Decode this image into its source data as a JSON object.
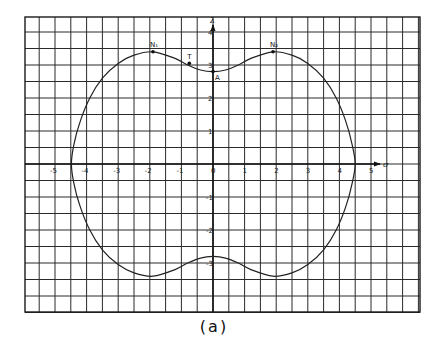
{
  "figure": {
    "caption": "(a)",
    "x_axis_name": "σ",
    "y_axis_name": "λ"
  },
  "chart_data": {
    "type": "line",
    "title": "",
    "xlabel": "σ",
    "ylabel": "λ",
    "xlim": [
      -6.0,
      6.5
    ],
    "ylim": [
      -4.5,
      4.5
    ],
    "grid": true,
    "x_ticks": [
      -5,
      -4,
      -3,
      -2,
      -1,
      0,
      1,
      2,
      3,
      4,
      5
    ],
    "x_tick_labels": [
      "-5",
      "-4",
      "-3",
      "-2",
      "-1",
      "0",
      "1",
      "2",
      "3",
      "4",
      "5"
    ],
    "y_ticks": [
      4,
      3,
      2,
      1,
      -1,
      -2,
      -3
    ],
    "y_tick_labels": [
      "4",
      "3",
      "2",
      "1",
      "-1",
      "-2",
      "-3"
    ],
    "series": [
      {
        "name": "closed locus",
        "description": "Closed curve symmetric about both axes, with shallow dimples at top and bottom near x=0",
        "points": [
          [
            0,
            2.8
          ],
          [
            -0.4,
            2.85
          ],
          [
            -0.8,
            3.0
          ],
          [
            -1.2,
            3.2
          ],
          [
            -1.9,
            3.4
          ],
          [
            -2.5,
            3.3
          ],
          [
            -3.0,
            3.05
          ],
          [
            -3.5,
            2.6
          ],
          [
            -3.9,
            2.0
          ],
          [
            -4.2,
            1.3
          ],
          [
            -4.4,
            0.6
          ],
          [
            -4.48,
            0
          ],
          [
            -4.4,
            -0.6
          ],
          [
            -4.2,
            -1.3
          ],
          [
            -3.9,
            -2.0
          ],
          [
            -3.5,
            -2.6
          ],
          [
            -3.0,
            -3.05
          ],
          [
            -2.5,
            -3.3
          ],
          [
            -1.9,
            -3.4
          ],
          [
            -1.2,
            -3.2
          ],
          [
            -0.8,
            -3.0
          ],
          [
            -0.4,
            -2.85
          ],
          [
            0,
            -2.8
          ],
          [
            0.4,
            -2.85
          ],
          [
            0.8,
            -3.0
          ],
          [
            1.2,
            -3.2
          ],
          [
            1.9,
            -3.4
          ],
          [
            2.5,
            -3.3
          ],
          [
            3.0,
            -3.05
          ],
          [
            3.5,
            -2.6
          ],
          [
            3.9,
            -2.0
          ],
          [
            4.2,
            -1.3
          ],
          [
            4.4,
            -0.6
          ],
          [
            4.5,
            0
          ],
          [
            4.4,
            0.6
          ],
          [
            4.2,
            1.3
          ],
          [
            3.9,
            2.0
          ],
          [
            3.5,
            2.6
          ],
          [
            3.0,
            3.05
          ],
          [
            2.5,
            3.3
          ],
          [
            1.9,
            3.4
          ],
          [
            1.2,
            3.2
          ],
          [
            0.8,
            3.0
          ],
          [
            0.4,
            2.85
          ],
          [
            0,
            2.8
          ]
        ]
      }
    ],
    "annotations": [
      {
        "label": "N₁",
        "x": -1.9,
        "y": 3.4
      },
      {
        "label": "T",
        "x": -0.75,
        "y": 3.05
      },
      {
        "label": "A",
        "x": 0,
        "y": 2.8
      },
      {
        "label": "N₂",
        "x": 1.9,
        "y": 3.4
      }
    ]
  }
}
